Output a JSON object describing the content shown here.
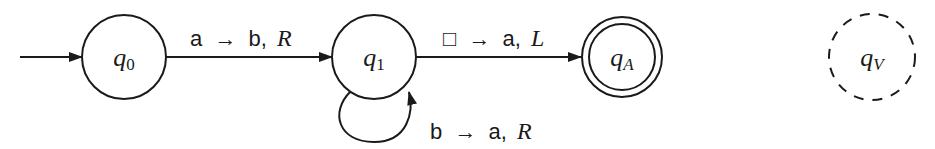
{
  "diagram": {
    "type": "turing-machine-state-diagram",
    "start_state": "q0",
    "states": [
      {
        "id": "q0",
        "base": "q",
        "subscript": "0",
        "kind": "start"
      },
      {
        "id": "q1",
        "base": "q",
        "subscript": "1",
        "kind": "normal"
      },
      {
        "id": "qA",
        "base": "q",
        "subscript": "A",
        "kind": "accept"
      },
      {
        "id": "qV",
        "base": "q",
        "subscript": "V",
        "kind": "reject-dashed"
      }
    ],
    "transitions": [
      {
        "from": "q0",
        "to": "q1",
        "read": "a",
        "arrow": "→",
        "write": "b,",
        "move": "R"
      },
      {
        "from": "q1",
        "to": "qA",
        "read": "□",
        "arrow": "→",
        "write": "a,",
        "move": "L"
      },
      {
        "from": "q1",
        "to": "q1",
        "read": "b",
        "arrow": "→",
        "write": "a,",
        "move": "R"
      }
    ],
    "colors": {
      "stroke": "#1a1a1a",
      "background": "#ffffff"
    }
  }
}
